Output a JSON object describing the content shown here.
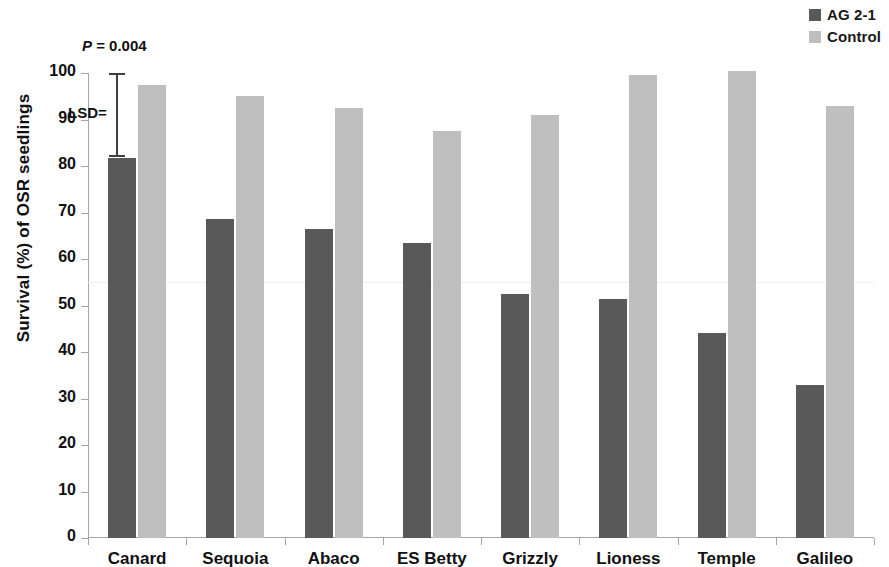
{
  "chart_data": {
    "type": "bar",
    "title": "",
    "xlabel": "",
    "ylabel": "Survival (%) of OSR seedlings",
    "ylim": [
      0,
      100
    ],
    "ytick_labels": [
      "100",
      "90",
      "80",
      "70",
      "60",
      "50",
      "40",
      "30",
      "20",
      "10",
      "0"
    ],
    "ytick_values": [
      100,
      90,
      80,
      70,
      60,
      50,
      40,
      30,
      20,
      10,
      0
    ],
    "grid": false,
    "legend_position": "top-right",
    "categories": [
      "Canard",
      "Sequoia",
      "Abaco",
      "ES Betty",
      "Grizzly",
      "Lioness",
      "Temple",
      "Galileo"
    ],
    "series": [
      {
        "name": "AG 2-1",
        "color": "#595959",
        "values": [
          81.8,
          68.5,
          66.5,
          63.5,
          52.4,
          51.4,
          44.0,
          32.8
        ]
      },
      {
        "name": "Control",
        "color": "#bfbfbf",
        "values": [
          97.5,
          95.0,
          92.5,
          87.5,
          91.0,
          99.5,
          100.5,
          93.0
        ]
      }
    ],
    "annotations": [
      {
        "name": "p-value",
        "text_prefix": "P",
        "text_rest": " = 0.004"
      },
      {
        "name": "lsd",
        "text": "LSD=",
        "bar_top_value": 100,
        "bar_bottom_value": 82
      }
    ]
  },
  "legend": {
    "items": [
      {
        "label": "AG 2-1",
        "color": "#595959"
      },
      {
        "label": "Control",
        "color": "#bfbfbf"
      }
    ]
  },
  "axes": {
    "y_title": "Survival (%) of OSR seedlings"
  },
  "annotations": {
    "p_italic": "P",
    "p_rest": " = 0.004",
    "lsd_label": "LSD="
  }
}
